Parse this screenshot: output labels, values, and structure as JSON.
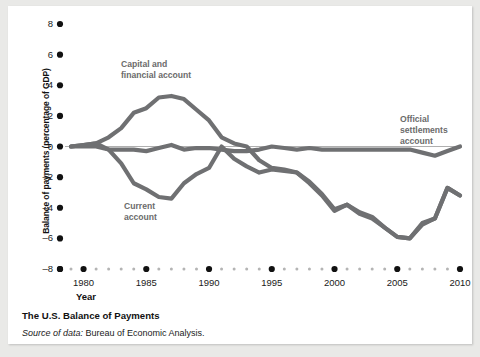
{
  "figure": {
    "caption_title": "The U.S. Balance of Payments",
    "source_lead": "Source of data:",
    "source_rest": " Bureau of Economic Analysis."
  },
  "annotations": {
    "capital": "Capital and\nfinancial account",
    "current": "Current\naccount",
    "official": "Official\nsettlements\naccount"
  },
  "colors": {
    "line": "#6f7072",
    "axis": "#9a9a9a",
    "tick_major": "#111111",
    "tick_minor": "#b4b4b4",
    "label": "#6b6b6b",
    "background": "#ffffff",
    "page": "#e9e9e7"
  },
  "chart_data": {
    "type": "line",
    "title": "The U.S. Balance of Payments",
    "xlabel": "Year",
    "ylabel": "Balance of payments (percentage of GDP)",
    "xlim": [
      1979,
      2010
    ],
    "ylim": [
      -8,
      8
    ],
    "xticks": [
      1980,
      1985,
      1990,
      1995,
      2000,
      2005,
      2010
    ],
    "yticks": [
      8,
      6,
      4,
      2,
      0,
      -2,
      -4,
      -6,
      -8
    ],
    "grid": false,
    "legend": "inline-annotations",
    "x": [
      1979,
      1980,
      1981,
      1982,
      1983,
      1984,
      1985,
      1986,
      1987,
      1988,
      1989,
      1990,
      1991,
      1992,
      1993,
      1994,
      1995,
      1996,
      1997,
      1998,
      1999,
      2000,
      2001,
      2002,
      2003,
      2004,
      2005,
      2006,
      2007,
      2008,
      2009,
      2010
    ],
    "series": [
      {
        "name": "Capital and financial account",
        "values": [
          0.0,
          0.1,
          0.2,
          0.6,
          1.2,
          2.2,
          2.5,
          3.2,
          3.3,
          3.1,
          2.4,
          1.7,
          0.6,
          0.2,
          0.0,
          -0.9,
          -1.4,
          -1.5,
          -1.7,
          -2.3,
          -3.1,
          -4.1,
          -3.8,
          -4.3,
          -4.6,
          -5.3,
          -5.9,
          -6.0,
          -5.1,
          -4.7,
          -2.7,
          -3.2
        ]
      },
      {
        "name": "Current account",
        "values": [
          0.0,
          0.1,
          0.2,
          -0.2,
          -1.1,
          -2.4,
          -2.8,
          -3.3,
          -3.4,
          -2.4,
          -1.8,
          -1.4,
          0.0,
          -0.8,
          -1.3,
          -1.7,
          -1.5,
          -1.6,
          -1.7,
          -2.4,
          -3.2,
          -4.2,
          -3.8,
          -4.4,
          -4.7,
          -5.3,
          -5.9,
          -6.0,
          -5.0,
          -4.7,
          -2.7,
          -3.2
        ]
      },
      {
        "name": "Official settlements account",
        "values": [
          0.0,
          0.0,
          0.0,
          -0.2,
          -0.2,
          -0.2,
          -0.3,
          -0.1,
          0.1,
          -0.2,
          -0.1,
          -0.1,
          -0.2,
          -0.3,
          -0.3,
          -0.2,
          0.0,
          -0.1,
          -0.2,
          -0.1,
          -0.2,
          -0.2,
          -0.2,
          -0.2,
          -0.2,
          -0.2,
          -0.2,
          -0.2,
          -0.4,
          -0.6,
          -0.3,
          0.0
        ]
      }
    ]
  }
}
